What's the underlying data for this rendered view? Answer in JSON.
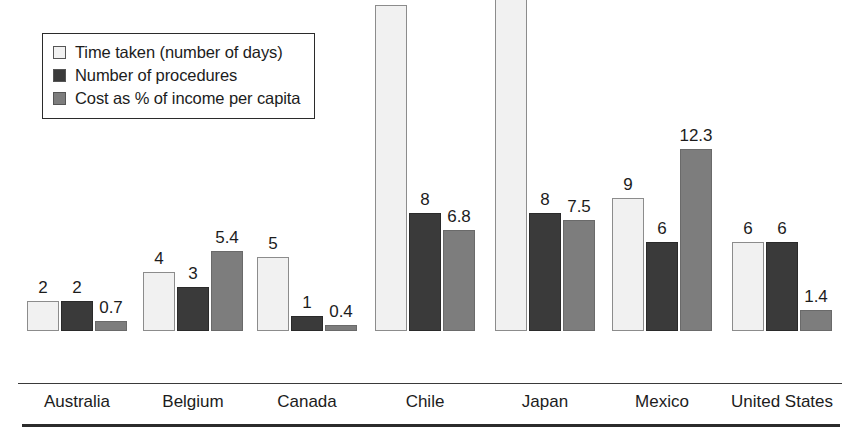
{
  "chart_data": {
    "type": "bar",
    "title": "",
    "subtitle": "",
    "xlabel": "",
    "ylabel": "",
    "grid": false,
    "legend_position": "top-left",
    "ylim": [
      0,
      23
    ],
    "categories": [
      "Australia",
      "Belgium",
      "Canada",
      "Chile",
      "Japan",
      "Mexico",
      "United States"
    ],
    "series": [
      {
        "name": "Time taken (number of days)",
        "color": "#f1f1f1",
        "values": [
          2,
          4,
          5,
          22,
          23,
          9,
          6
        ],
        "labels": [
          "2",
          "4",
          "5",
          "22",
          "23",
          "9",
          "6"
        ]
      },
      {
        "name": "Number of procedures",
        "color": "#3a3a3a",
        "values": [
          2,
          3,
          1,
          8,
          8,
          6,
          6
        ],
        "labels": [
          "2",
          "3",
          "1",
          "8",
          "8",
          "6",
          "6"
        ]
      },
      {
        "name": "Cost as % of income per capita",
        "color": "#7d7d7d",
        "values": [
          0.7,
          5.4,
          0.4,
          6.8,
          7.5,
          12.3,
          1.4
        ],
        "labels": [
          "0.7",
          "5.4",
          "0.4",
          "6.8",
          "7.5",
          "12.3",
          "1.4"
        ]
      }
    ]
  },
  "legend": {
    "items": [
      {
        "label": "Time taken (number of days)",
        "swatch": "#f1f1f1"
      },
      {
        "label": "Number of procedures",
        "swatch": "#3a3a3a"
      },
      {
        "label": "Cost as % of income per capita",
        "swatch": "#7d7d7d"
      }
    ]
  },
  "axis": {
    "categories": [
      "Australia",
      "Belgium",
      "Canada",
      "Chile",
      "Japan",
      "Mexico",
      "United States"
    ]
  }
}
